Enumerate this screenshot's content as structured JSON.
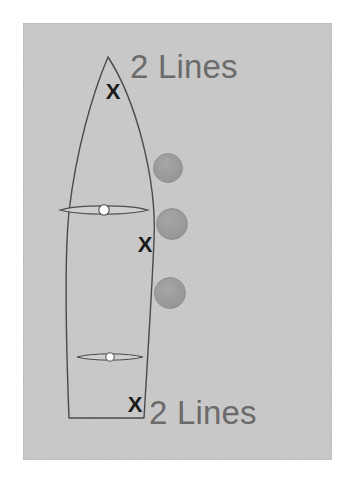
{
  "figure": {
    "canvas": {
      "width": 352,
      "height": 482,
      "background": "#ffffff"
    },
    "panel": {
      "name": "photo-panel",
      "x": 23,
      "y": 23,
      "width": 309,
      "height": 437,
      "fill": "#c9c9c9",
      "border_color": "#b6b6b6",
      "texture": "noisy-paper"
    },
    "labels": [
      {
        "id": "label-top",
        "text": "2 Lines",
        "x": 130,
        "y": 78,
        "font_size": 33,
        "color": "#6b6b6b",
        "anchor": "start"
      },
      {
        "id": "label-bottom",
        "text": "2 Lines",
        "x": 149,
        "y": 424,
        "font_size": 33,
        "color": "#6b6b6b",
        "anchor": "start"
      }
    ],
    "x_marks": [
      {
        "id": "x-nose",
        "text": "X",
        "x": 113,
        "y": 99,
        "font_size": 22,
        "color": "#1c1c1c"
      },
      {
        "id": "x-middle",
        "text": "X",
        "x": 145,
        "y": 252,
        "font_size": 22,
        "color": "#1c1c1c"
      },
      {
        "id": "x-tail",
        "text": "X",
        "x": 135,
        "y": 412,
        "font_size": 22,
        "color": "#1c1c1c"
      }
    ],
    "circles": [
      {
        "id": "circle-upper",
        "cx": 168,
        "cy": 168,
        "r": 14.5,
        "fill": "#9a9a9a",
        "stroke": "#8a8a8a"
      },
      {
        "id": "circle-middle",
        "cx": 172,
        "cy": 224,
        "r": 15.5,
        "fill": "#9a9a9a",
        "stroke": "#8a8a8a"
      },
      {
        "id": "circle-lower",
        "cx": 170,
        "cy": 293,
        "r": 15.5,
        "fill": "#9a9a9a",
        "stroke": "#8a8a8a"
      }
    ],
    "board": {
      "name": "board-outline",
      "stroke": "#4a4a4a",
      "stroke_width": 1.4,
      "fill": "none",
      "nose_tip": {
        "x": 108,
        "y": 57
      },
      "tail_left": {
        "x": 69,
        "y": 418
      },
      "tail_right": {
        "x": 144,
        "y": 418
      },
      "path": "M108,57 C93,92 76,150 69,212 C64,260 66,340 69,418 L144,418 C148,350 152,290 154,240 C157,180 136,100 108,57 Z"
    },
    "inserts": [
      {
        "id": "insert-upper",
        "label": "foot-insert-marker",
        "cx": 104,
        "cy": 210,
        "half_width": 44,
        "half_height": 5.5,
        "hub_r": 5.2,
        "stroke": "#4a4a4a",
        "hub_fill": "#ffffff"
      },
      {
        "id": "insert-lower",
        "label": "foot-insert-marker",
        "cx": 110,
        "cy": 357,
        "half_width": 33,
        "half_height": 4.2,
        "hub_r": 4.2,
        "stroke": "#4a4a4a",
        "hub_fill": "#ffffff"
      }
    ]
  }
}
